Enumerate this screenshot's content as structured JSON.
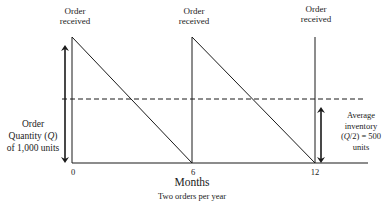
{
  "diagram": {
    "type": "inventory-sawtooth",
    "top_labels": [
      {
        "line1": "Order",
        "line2": "received"
      },
      {
        "line1": "Order",
        "line2": "received"
      },
      {
        "line1": "Order",
        "line2": "received"
      }
    ],
    "left_label": {
      "line1": "Order",
      "line2_pre": "Quantity (",
      "line2_var": "Q",
      "line2_post": ")",
      "line3": "of 1,000 units"
    },
    "right_label": {
      "line1": "Average",
      "line2": "inventory",
      "line3_pre": "(",
      "line3_var": "Q",
      "line3_post": "/2) = 500",
      "line4": "units"
    },
    "x_ticks": [
      "0",
      "6",
      "12"
    ],
    "x_axis_title": "Months",
    "x_axis_subtitle": "Two orders per year",
    "order_quantity": 1000,
    "average_inventory": 500,
    "cycle_length_months": 6,
    "order_months": [
      0,
      6,
      12
    ],
    "colors": {
      "line": "#1a1a1a",
      "background": "#ffffff"
    }
  }
}
